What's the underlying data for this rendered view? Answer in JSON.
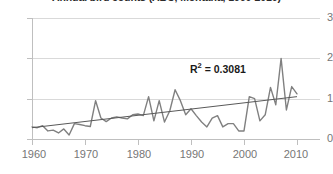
{
  "chart_data": {
    "type": "line",
    "title": "Annual bird counts (ABC, Montana, 1960-2010)",
    "xlabel": "",
    "ylabel": "",
    "xlim": [
      1960,
      2010
    ],
    "ylim": [
      0,
      3
    ],
    "grid": true,
    "legend": false,
    "y_ticks": [
      "0",
      "1",
      "2",
      "3"
    ],
    "y_tick_values": [
      0,
      1,
      2,
      3
    ],
    "x_ticks": [
      "1960",
      "1970",
      "1980",
      "1990",
      "2000",
      "2010"
    ],
    "x_tick_values": [
      1960,
      1970,
      1980,
      1990,
      2000,
      2010
    ],
    "annotations": [
      {
        "name": "r-squared",
        "text": "R² = 0.3081",
        "symbol": "R",
        "superscript": "2",
        "rest": " = 0.3081",
        "value": 0.3081
      }
    ],
    "series": [
      {
        "name": "annual-count",
        "color": "#808080",
        "x": [
          1960,
          1961,
          1962,
          1963,
          1964,
          1965,
          1966,
          1967,
          1968,
          1969,
          1970,
          1971,
          1972,
          1973,
          1974,
          1975,
          1976,
          1977,
          1978,
          1979,
          1980,
          1981,
          1982,
          1983,
          1984,
          1985,
          1986,
          1987,
          1988,
          1989,
          1990,
          1991,
          1992,
          1993,
          1994,
          1995,
          1996,
          1997,
          1998,
          1999,
          2000,
          2001,
          2002,
          2003,
          2004,
          2005,
          2006,
          2007,
          2008,
          2009,
          2010
        ],
        "values": [
          0.3,
          0.28,
          0.33,
          0.2,
          0.22,
          0.15,
          0.25,
          0.1,
          0.38,
          0.36,
          0.33,
          0.31,
          0.95,
          0.52,
          0.43,
          0.52,
          0.55,
          0.52,
          0.5,
          0.6,
          0.62,
          0.58,
          1.05,
          0.45,
          0.95,
          0.42,
          0.7,
          1.22,
          0.95,
          0.6,
          0.75,
          0.58,
          0.42,
          0.3,
          0.52,
          0.58,
          0.3,
          0.38,
          0.38,
          0.2,
          0.2,
          1.05,
          1.0,
          0.45,
          0.6,
          1.28,
          0.85,
          2.0,
          0.72,
          1.3,
          1.12
        ]
      },
      {
        "name": "linear-trendline",
        "color": "#595959",
        "x": [
          1960,
          2010
        ],
        "values": [
          0.28,
          1.05
        ]
      }
    ]
  }
}
